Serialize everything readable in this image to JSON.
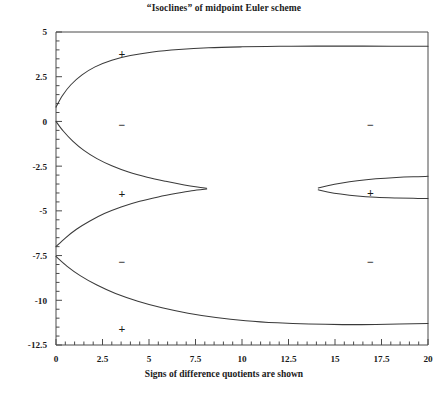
{
  "chart_data": {
    "type": "line",
    "title": "“Isoclines” of midpoint Euler scheme",
    "xlabel": "Signs of difference quotients are shown",
    "ylabel": "",
    "xlim": [
      0,
      20
    ],
    "ylim": [
      -12.5,
      5
    ],
    "grid": false,
    "legend": "none",
    "xticks": [
      0,
      2.5,
      5,
      7.5,
      10,
      12.5,
      15,
      17.5,
      20
    ],
    "xtick_labels": [
      "0",
      "2.5",
      "5",
      "7.5",
      "10",
      "12.5",
      "15",
      "17.5",
      "20"
    ],
    "yticks": [
      5,
      2.5,
      0,
      -2.5,
      -5,
      -7.5,
      -10,
      -12.5
    ],
    "ytick_labels": [
      "5",
      "2.5",
      "0",
      "-2.5",
      "-5",
      "-7.5",
      "-10",
      "-12.5"
    ],
    "x_minor_tick_step": 0.5,
    "y_minor_tick_step": 0.5,
    "series": [
      {
        "name": "upper-isocline-branch-1",
        "comment": "upper branch of first tongue, rises from (0,0.8) to plateau near y=4.2 at x=20",
        "points": [
          [
            0.0,
            0.8
          ],
          [
            0.35,
            1.45
          ],
          [
            0.8,
            2.05
          ],
          [
            1.4,
            2.6
          ],
          [
            2.1,
            3.05
          ],
          [
            3.0,
            3.42
          ],
          [
            4.0,
            3.68
          ],
          [
            5.2,
            3.88
          ],
          [
            6.6,
            4.02
          ],
          [
            8.2,
            4.12
          ],
          [
            10.0,
            4.17
          ],
          [
            12.0,
            4.2
          ],
          [
            14.0,
            4.21
          ],
          [
            16.5,
            4.21
          ],
          [
            20.0,
            4.2
          ]
        ]
      },
      {
        "name": "lower-isocline-branch-1",
        "comment": "lower branch of first tongue, falls from (0,0.0) and closes with upper partner near x=8, y=-3.75",
        "points": [
          [
            0.0,
            0.0
          ],
          [
            0.4,
            -0.55
          ],
          [
            0.9,
            -1.1
          ],
          [
            1.5,
            -1.62
          ],
          [
            2.2,
            -2.08
          ],
          [
            3.0,
            -2.48
          ],
          [
            3.9,
            -2.83
          ],
          [
            4.9,
            -3.12
          ],
          [
            5.9,
            -3.35
          ],
          [
            6.9,
            -3.55
          ],
          [
            7.6,
            -3.67
          ],
          [
            8.1,
            -3.74
          ]
        ]
      },
      {
        "name": "isocline-branch-2-upper",
        "comment": "upper arc of the lens that closes at x≈8, y≈-3.75 coming up from below",
        "points": [
          [
            0.0,
            -7.0
          ],
          [
            0.5,
            -6.52
          ],
          [
            1.1,
            -6.03
          ],
          [
            1.8,
            -5.58
          ],
          [
            2.6,
            -5.15
          ],
          [
            3.5,
            -4.78
          ],
          [
            4.5,
            -4.46
          ],
          [
            5.5,
            -4.22
          ],
          [
            6.5,
            -4.02
          ],
          [
            7.3,
            -3.88
          ],
          [
            8.1,
            -3.78
          ]
        ]
      },
      {
        "name": "lower-isocline-outer",
        "comment": "outermost lower curve from (0,-7.55) sagging to minimum y≈-11.35 around x=16 then flattening",
        "points": [
          [
            0.0,
            -7.55
          ],
          [
            0.6,
            -8.1
          ],
          [
            1.3,
            -8.62
          ],
          [
            2.2,
            -9.15
          ],
          [
            3.2,
            -9.62
          ],
          [
            4.4,
            -10.05
          ],
          [
            5.7,
            -10.42
          ],
          [
            7.1,
            -10.72
          ],
          [
            8.6,
            -10.96
          ],
          [
            10.2,
            -11.14
          ],
          [
            11.9,
            -11.26
          ],
          [
            13.6,
            -11.33
          ],
          [
            15.4,
            -11.36
          ],
          [
            17.2,
            -11.35
          ],
          [
            20.0,
            -11.3
          ]
        ]
      },
      {
        "name": "isocline-branch-3-upper",
        "comment": "upper branch of second tongue opening at x≈14.1, y≈-3.72 and running to (20,-3.07)",
        "points": [
          [
            14.1,
            -3.72
          ],
          [
            14.6,
            -3.6
          ],
          [
            15.3,
            -3.46
          ],
          [
            16.2,
            -3.32
          ],
          [
            17.2,
            -3.21
          ],
          [
            18.3,
            -3.13
          ],
          [
            19.2,
            -3.09
          ],
          [
            20.0,
            -3.07
          ]
        ]
      },
      {
        "name": "isocline-branch-3-lower",
        "comment": "lower branch of second tongue opening at x≈14.1, y≈-3.82 and running to (20,-4.30)",
        "points": [
          [
            14.1,
            -3.82
          ],
          [
            14.6,
            -3.94
          ],
          [
            15.3,
            -4.06
          ],
          [
            16.2,
            -4.17
          ],
          [
            17.2,
            -4.24
          ],
          [
            18.3,
            -4.28
          ],
          [
            19.2,
            -4.3
          ],
          [
            20.0,
            -4.31
          ]
        ]
      }
    ],
    "sign_annotations": [
      {
        "label": "+",
        "x": 3.55,
        "y": 3.8,
        "region": "inside-upper-tongue"
      },
      {
        "label": "−",
        "x": 3.55,
        "y": -0.15,
        "region": "between-branches-left-upper"
      },
      {
        "label": "+",
        "x": 3.55,
        "y": -4.05,
        "region": "inside-first-lens"
      },
      {
        "label": "−",
        "x": 3.55,
        "y": -7.85,
        "region": "between-branches-left-lower"
      },
      {
        "label": "+",
        "x": 3.55,
        "y": -11.55,
        "region": "below-outer-lower-curve"
      },
      {
        "label": "−",
        "x": 16.9,
        "y": -0.15,
        "region": "right-upper-gap"
      },
      {
        "label": "+",
        "x": 16.9,
        "y": -3.95,
        "region": "inside-second-tongue"
      },
      {
        "label": "−",
        "x": 16.9,
        "y": -7.85,
        "region": "right-lower-gap"
      }
    ]
  }
}
